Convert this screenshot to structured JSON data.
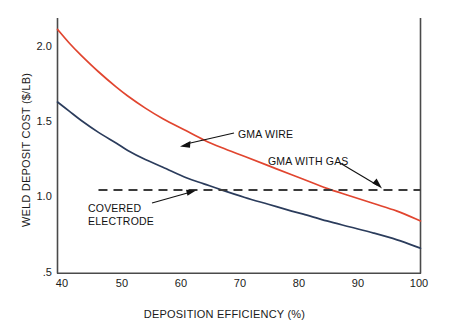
{
  "chart_data": {
    "type": "line",
    "title": "",
    "xlabel": "DEPOSITION EFFICIENCY (%)",
    "ylabel": "WELD DEPOSIT COST ($/LB)",
    "xlim": [
      38,
      100
    ],
    "ylim": [
      0.5,
      2.2
    ],
    "xticks": [
      40,
      50,
      60,
      70,
      80,
      90,
      100
    ],
    "xtick_labels": [
      "40",
      "50",
      "60",
      "70",
      "80",
      "90",
      "100"
    ],
    "yticks": [
      0.5,
      1.0,
      1.5,
      2.0
    ],
    "ytick_labels": [
      ".5",
      "1.0",
      "1.5",
      "2.0"
    ],
    "grid": false,
    "legend_position": "inline-annotations",
    "series": [
      {
        "name": "GMA WIRE",
        "color": "#e1452f",
        "style": "solid",
        "x": [
          38,
          40,
          42,
          45,
          48,
          50,
          53,
          56,
          60,
          63,
          66,
          70,
          74,
          78,
          80,
          84,
          88,
          92,
          96,
          100
        ],
        "values": [
          2.11,
          2.02,
          1.94,
          1.83,
          1.73,
          1.67,
          1.59,
          1.52,
          1.44,
          1.38,
          1.33,
          1.27,
          1.21,
          1.15,
          1.12,
          1.06,
          1.01,
          0.96,
          0.91,
          0.845
        ]
      },
      {
        "name": "COVERED ELECTRODE",
        "color": "#2b3c5c",
        "style": "solid",
        "x": [
          38,
          40,
          42,
          45,
          48,
          50,
          53,
          56,
          60,
          63,
          66,
          70,
          74,
          78,
          80,
          84,
          88,
          92,
          96,
          100
        ],
        "values": [
          1.63,
          1.57,
          1.51,
          1.43,
          1.36,
          1.31,
          1.25,
          1.2,
          1.13,
          1.09,
          1.05,
          1.0,
          0.955,
          0.91,
          0.89,
          0.845,
          0.805,
          0.765,
          0.72,
          0.665
        ]
      },
      {
        "name": "GMA WITH GAS",
        "color": "#3b3b3b",
        "style": "dashed",
        "x": [
          45,
          100
        ],
        "values": [
          1.05,
          1.05
        ]
      }
    ],
    "annotations": [
      {
        "label": "GMA WIRE",
        "target_x": 62,
        "target_y": 1.4,
        "text_x": 238,
        "text_y": 128
      },
      {
        "label": "GMA WITH GAS",
        "target_x": 93,
        "target_y": 1.05,
        "text_x": 268,
        "text_y": 155
      },
      {
        "label_line1": "COVERED",
        "label_line2": "ELECTRODE",
        "target_x": 64,
        "target_y": 1.03,
        "text_x": 88,
        "text_y": 202
      }
    ],
    "colors": {
      "gma_wire": "#e1452f",
      "covered_electrode": "#2b3c5c",
      "gma_with_gas": "#3b3b3b",
      "axis": "#4a4a4a",
      "text": "#111111",
      "background": "#ffffff"
    }
  },
  "axes": {
    "x_title": "DEPOSITION EFFICIENCY (%)",
    "y_title": "WELD DEPOSIT COST ($/LB)",
    "x_tick_labels": [
      "40",
      "50",
      "60",
      "70",
      "80",
      "90",
      "100"
    ],
    "y_tick_labels": [
      "2.0",
      "1.5",
      "1.0",
      ".5"
    ]
  },
  "annotations": {
    "gma_wire": "GMA WIRE",
    "gma_with_gas": "GMA WITH GAS",
    "covered_electrode_line1": "COVERED",
    "covered_electrode_line2": "ELECTRODE"
  }
}
